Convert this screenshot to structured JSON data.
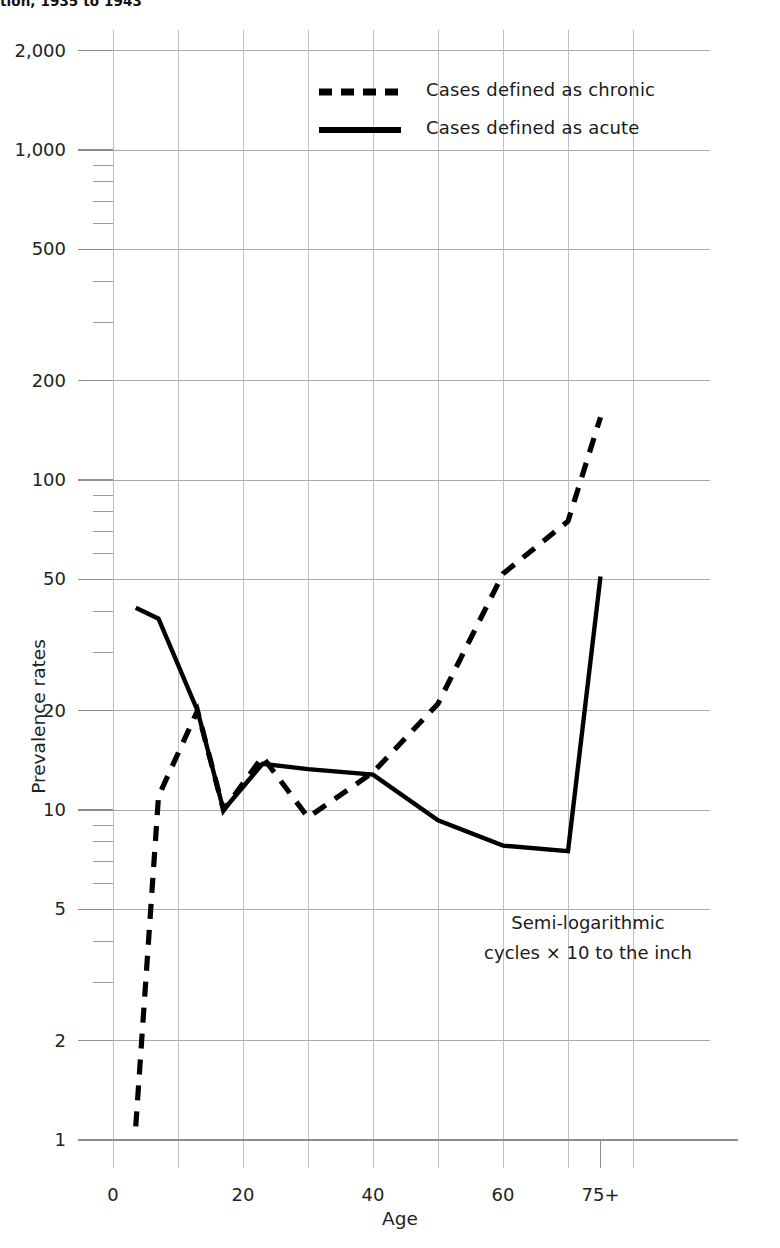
{
  "figure": {
    "title": "tion, 1935 to 1943",
    "annotation_line1": "Semi-logarithmic",
    "annotation_line2": "cycles × 10 to the inch"
  },
  "legend": {
    "items": [
      {
        "label": "Cases defined as chronic",
        "style": "dashed",
        "color": "#000000"
      },
      {
        "label": "Cases defined as acute",
        "style": "solid",
        "color": "#000000"
      }
    ]
  },
  "axes": {
    "y_label": "Prevalence rates",
    "x_label": "Age",
    "y_ticks": [
      "2,000",
      "1,000",
      "500",
      "200",
      "100",
      "50",
      "20",
      "10",
      "5",
      "2",
      "1"
    ],
    "x_ticks": [
      "0",
      "20",
      "40",
      "60",
      "75+"
    ]
  },
  "chart_data": {
    "type": "line",
    "title": "tion, 1935 to 1943",
    "xlabel": "Age",
    "ylabel": "Prevalence rates",
    "yscale": "log",
    "ylim": [
      1,
      2000
    ],
    "xlim": [
      0,
      80
    ],
    "grid": true,
    "legend_position": "top-center",
    "annotation": "Semi-logarithmic cycles × 10 to the inch",
    "y_tick_values": [
      2000,
      1000,
      500,
      200,
      100,
      50,
      20,
      10,
      5,
      2,
      1
    ],
    "y_tick_labels": [
      "2,000",
      "1,000",
      "500",
      "200",
      "100",
      "50",
      "20",
      "10",
      "5",
      "2",
      "1"
    ],
    "x_tick_values": [
      0,
      20,
      40,
      60,
      75
    ],
    "x_tick_labels": [
      "0",
      "20",
      "40",
      "60",
      "75+"
    ],
    "series": [
      {
        "name": "Cases defined as chronic",
        "style": "dashed",
        "color": "#000000",
        "x": [
          3.5,
          7,
          13,
          17,
          23,
          30,
          40,
          50,
          60,
          70,
          75
        ],
        "y": [
          1.1,
          11,
          20,
          10,
          14.5,
          9.5,
          13,
          21,
          52,
          75,
          155
        ]
      },
      {
        "name": "Cases defined as acute",
        "style": "solid",
        "color": "#000000",
        "x": [
          3.5,
          7,
          13,
          17,
          23,
          30,
          40,
          50,
          60,
          70,
          75
        ],
        "y": [
          41,
          38,
          20,
          10,
          13.8,
          13.3,
          12.8,
          9.3,
          7.8,
          7.5,
          51
        ]
      }
    ]
  }
}
